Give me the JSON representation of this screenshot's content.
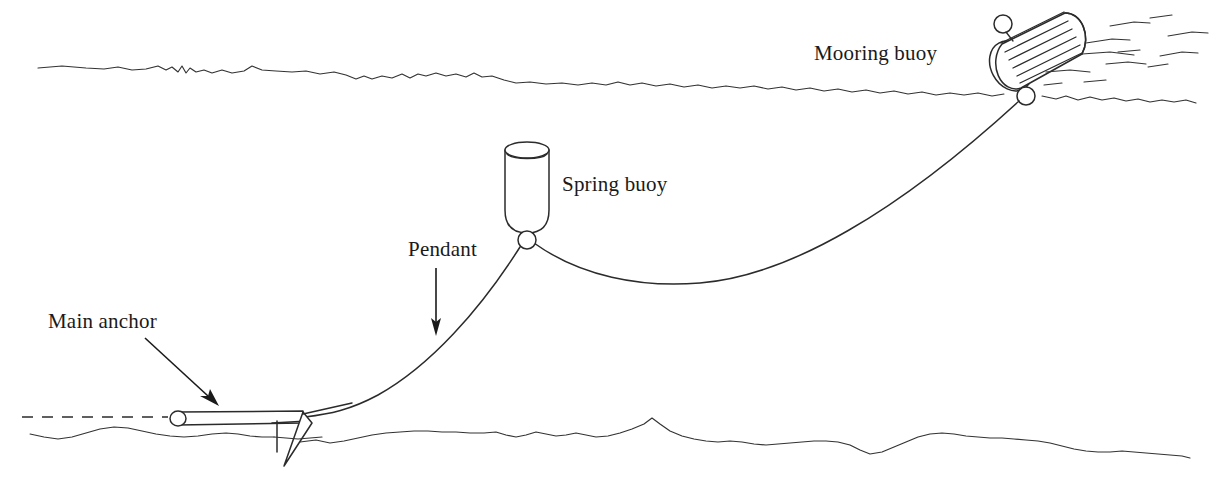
{
  "diagram": {
    "background_color": "#ffffff",
    "line_color": "#2b2b2b",
    "text_color": "#1a1a1a",
    "width": 1216,
    "height": 491
  },
  "labels": [
    {
      "id": "mooring-buoy",
      "text": "Mooring buoy",
      "x": 814,
      "y": 60,
      "has_leader": false
    },
    {
      "id": "spring-buoy",
      "text": "Spring buoy",
      "x": 562,
      "y": 191,
      "has_leader": false
    },
    {
      "id": "pendant",
      "text": "Pendant",
      "x": 408,
      "y": 256,
      "has_leader": true,
      "leader_type": "straight-down-arrow"
    },
    {
      "id": "main-anchor",
      "text": "Main anchor",
      "x": 48,
      "y": 328,
      "has_leader": true,
      "leader_type": "diagonal-arrow"
    }
  ],
  "components": {
    "water_surface": {
      "name": "water-surface-line",
      "description": "irregular wavy sea surface line",
      "y_nominal": 72
    },
    "seabed": {
      "name": "seabed-line",
      "description": "irregular wavy sea floor line",
      "y_nominal": 432
    },
    "reference_dashed_line": {
      "name": "anchor-reference-dashed-line",
      "description": "dashed horizontal reference at anchor shank level",
      "y_nominal": 419
    },
    "mooring_buoy": {
      "name": "mooring-buoy",
      "description": "tilted striped cylindrical surface buoy with top and bottom rings",
      "center_x": 1029,
      "center_y": 62,
      "stripes": 6
    },
    "spring_buoy": {
      "name": "spring-buoy",
      "description": "vertical cylinder with rounded base and attachment ring",
      "center_x": 527,
      "top_y": 143,
      "bottom_y": 231
    },
    "main_anchor": {
      "name": "main-anchor",
      "description": "stock anchor shank with ring at head and single triangular fluke",
      "shank_left_x": 170,
      "shank_right_x": 305,
      "shank_y": 419,
      "fluke_tip_y": 466
    },
    "pendant_line": {
      "name": "pendant-mooring-line",
      "description": "curved chain from anchor up to spring buoy ring"
    },
    "riser_line": {
      "name": "catenary-riser-line",
      "description": "sagging catenary from spring buoy ring to mooring buoy"
    },
    "wake": {
      "name": "surface-wake-marks",
      "description": "short dashes indicating current and wake right of mooring buoy",
      "count": 12
    }
  }
}
